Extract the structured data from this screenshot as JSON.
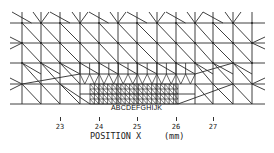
{
  "diagram": {
    "type": "finite-element-mesh",
    "line_color": "#2a2a2a",
    "mesh": {
      "x_left": 10,
      "x_right": 265,
      "y_top": 12,
      "rows": [
        23,
        43,
        63,
        74,
        84,
        94,
        104
      ],
      "coarse_cols": [
        22,
        41,
        60,
        80,
        99,
        118,
        137,
        157,
        176,
        195,
        213,
        233,
        252
      ],
      "refined_region": {
        "x0": 90,
        "x1": 178,
        "y0": 84,
        "y1": 104,
        "nx": 20,
        "ny": 4
      }
    },
    "node_labels": "ABCDEFGHIJK",
    "x_axis": {
      "ticks": [
        {
          "x": 60,
          "label": "23"
        },
        {
          "x": 99,
          "label": "24"
        },
        {
          "x": 137,
          "label": "25"
        },
        {
          "x": 176,
          "label": "26"
        },
        {
          "x": 213,
          "label": "27"
        }
      ],
      "title": "POSITION  X",
      "unit": "(mm)"
    }
  }
}
